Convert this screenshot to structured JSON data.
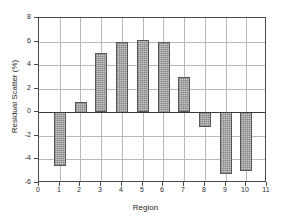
{
  "chart_data": {
    "type": "bar",
    "title": "",
    "xlabel": "Region",
    "ylabel": "Residual Scatter (%)",
    "categories": [
      1,
      2,
      3,
      4,
      5,
      6,
      7,
      8,
      9,
      10
    ],
    "values": [
      -4.6,
      0.9,
      5.0,
      6.0,
      6.1,
      6.0,
      3.0,
      -1.3,
      -5.3,
      -5.0
    ],
    "xlim": [
      0,
      11
    ],
    "ylim": [
      -6,
      8
    ],
    "xticks": [
      "0",
      "1",
      "2",
      "3",
      "4",
      "5",
      "6",
      "7",
      "8",
      "9",
      "10",
      "11"
    ],
    "yticks": [
      "8",
      "6",
      "4",
      "2",
      "0",
      "-2",
      "-4",
      "-6"
    ],
    "grid": true,
    "legend": null,
    "bar_fill_color": "#c9c9c9",
    "bar_edge_color": "#58585a",
    "grid_color": "#b9b9b9",
    "axis_color": "#4a4a4a",
    "background_color": "#ffffff"
  }
}
